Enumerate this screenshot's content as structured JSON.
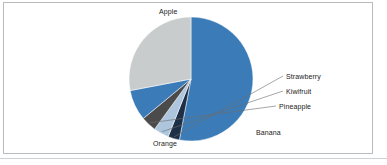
{
  "chart_data": {
    "type": "pie",
    "title": "",
    "subtitle": "",
    "xlabel": "",
    "ylabel": "",
    "legend_position": "none",
    "labels_position": "outside-leader",
    "grid": false,
    "start_angle_deg": 0,
    "direction": "clockwise",
    "categories": [
      "Apple",
      "Orange",
      "Banana",
      "Pineapple",
      "Kiwifruit",
      "Strawberry"
    ],
    "values": [
      53,
      28,
      8,
      4,
      4,
      3
    ],
    "unit": "percent",
    "slices": [
      {
        "label": "Apple",
        "value": 53,
        "color": "#3b7cb8",
        "start_deg": 0,
        "end_deg": 190.8
      },
      {
        "label": "Strawberry",
        "value": 3,
        "color": "#1e3047",
        "start_deg": 190.8,
        "end_deg": 201.6
      },
      {
        "label": "Kiwifruit",
        "value": 4,
        "color": "#adc6de",
        "start_deg": 201.6,
        "end_deg": 216.0
      },
      {
        "label": "Pineapple",
        "value": 4,
        "color": "#4b4b4b",
        "start_deg": 216.0,
        "end_deg": 230.4
      },
      {
        "label": "Banana",
        "value": 8,
        "color": "#3b7cb8",
        "start_deg": 230.4,
        "end_deg": 259.2
      },
      {
        "label": "Orange",
        "value": 28,
        "color": "#c9cccd",
        "start_deg": 259.2,
        "end_deg": 360.0
      }
    ],
    "labels": {
      "apple": "Apple",
      "strawberry": "Strawberry",
      "kiwifruit": "Kiwifruit",
      "pineapple": "Pineapple",
      "banana": "Banana",
      "orange": "Orange"
    },
    "colors": {
      "apple": "#3b7cb8",
      "orange": "#c9cccd",
      "banana": "#3b7cb8",
      "pineapple": "#4b4b4b",
      "kiwifruit": "#adc6de",
      "strawberry": "#1e3047",
      "background": "#ffffff",
      "text": "#1a1a1a",
      "frame": "#b9bcbe"
    },
    "geometry": {
      "center_x": 191,
      "center_y": 79,
      "radius": 62
    }
  }
}
